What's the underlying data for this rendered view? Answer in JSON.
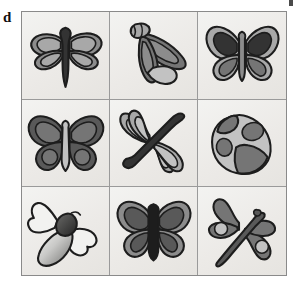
{
  "figure": {
    "panel_label": "d",
    "caption_visible": false,
    "grid": {
      "rows": 3,
      "columns": 3,
      "background_color": "#efefec",
      "border_color": "#8a8a8a",
      "divider_color": "#9a9a9a"
    }
  },
  "palette": {
    "outline": "#1d1d1d",
    "very_dark": "#333333",
    "dark_gray": "#595959",
    "mid_gray": "#757575",
    "gray": "#8c8c8c",
    "light_gray": "#a8a8a8",
    "pale_gray": "#c2c2c2",
    "very_pale": "#dedede",
    "near_white": "#f2f2f0",
    "cell_background": "#efefec"
  },
  "cells": [
    {
      "position": "row1-col1",
      "row": 1,
      "column": 1,
      "icon_name": "dragonfly-icon",
      "subject": "dragonfly",
      "orientation": "upright, wings spread horizontally",
      "body_color": "#333333",
      "wing_color": "#8c8c8c",
      "wing_inner_color": "#a8a8a8",
      "spots": 0
    },
    {
      "position": "row1-col2",
      "row": 1,
      "column": 2,
      "icon_name": "moth-icon",
      "subject": "moth",
      "orientation": "tilted, wings folded down-left",
      "body_color": "#757575",
      "wing_color": "#8c8c8c",
      "wing_inner_color": "#c2c2c2",
      "spots": 0
    },
    {
      "position": "row1-col3",
      "row": 1,
      "column": 3,
      "icon_name": "butterfly-icon",
      "subject": "butterfly",
      "orientation": "upright, symmetric wings",
      "body_color": "#8c8c8c",
      "wing_color": "#a8a8a8",
      "wing_inner_color": "#333333",
      "spots": 0
    },
    {
      "position": "row2-col1",
      "row": 2,
      "column": 1,
      "icon_name": "butterfly-icon",
      "subject": "butterfly",
      "orientation": "upright, ringed lower wings",
      "body_color": "#c2c2c2",
      "wing_color": "#595959",
      "wing_inner_color": "#757575",
      "spots": 2
    },
    {
      "position": "row2-col2",
      "row": 2,
      "column": 2,
      "icon_name": "dragonfly-icon",
      "subject": "dragonfly",
      "orientation": "diagonal, body from lower-left to upper-right",
      "body_color": "#333333",
      "wing_color": "#a8a8a8",
      "wing_inner_color": "#c2c2c2",
      "spots": 0
    },
    {
      "position": "row2-col3",
      "row": 2,
      "column": 3,
      "icon_name": "ladybug-icon",
      "subject": "ladybug",
      "orientation": "tilted oval shell",
      "body_color": "#757575",
      "wing_color": "#c2c2c2",
      "wing_inner_color": "#8c8c8c",
      "spots": 3
    },
    {
      "position": "row3-col1",
      "row": 3,
      "column": 1,
      "icon_name": "bee-icon",
      "subject": "bee",
      "orientation": "tilted, pale outlined wings and gradient abdomen",
      "body_color": "#333333",
      "wing_color": "#f2f2f0",
      "wing_inner_color": "#dedede",
      "spots": 0
    },
    {
      "position": "row3-col2",
      "row": 3,
      "column": 2,
      "icon_name": "butterfly-icon",
      "subject": "butterfly",
      "orientation": "upright, dark body stripe",
      "body_color": "#1d1d1d",
      "wing_color": "#8c8c8c",
      "wing_inner_color": "#595959",
      "spots": 0
    },
    {
      "position": "row3-col3",
      "row": 3,
      "column": 3,
      "icon_name": "dragonfly-icon",
      "subject": "dragonfly",
      "orientation": "diagonal, body from lower-left to upper-right, spotted wings",
      "body_color": "#595959",
      "wing_color": "#757575",
      "wing_inner_color": "#c2c2c2",
      "spots": 2
    }
  ]
}
